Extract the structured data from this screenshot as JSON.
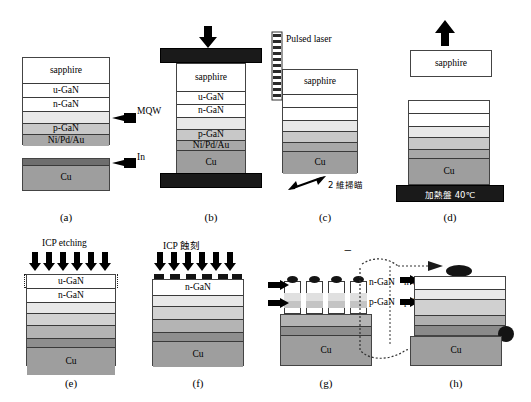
{
  "figure": {
    "colors": {
      "sapphire": "#ffffff",
      "u_gan": "#ffffff",
      "n_gan": "#ffffff",
      "mqw": "#e8e8e8",
      "p_gan": "#c8c8c8",
      "metal": "#a8a8a8",
      "cu": "#9e9e9e",
      "in": "#6e6e6e",
      "plate": "#1a1a1a",
      "outline": "#3a3a3a"
    }
  },
  "panels": [
    {
      "id": "a",
      "caption": "(a)",
      "layers": [
        "sapphire",
        "u-GaN",
        "n-GaN",
        "",
        "p-GaN",
        "Ni/Pd/Au"
      ],
      "callouts": [
        "MQW",
        "In"
      ],
      "substrate": "Cu"
    },
    {
      "id": "b",
      "caption": "(b)",
      "layers": [
        "sapphire",
        "u-GaN",
        "n-GaN",
        "",
        "p-GaN",
        "Ni/Pd/Au",
        "Cu"
      ],
      "annotation": "press-arrow"
    },
    {
      "id": "c",
      "caption": "(c)",
      "laser_label": "Pulsed laser",
      "scan_label": "2 維掃瞄",
      "layers": [
        "sapphire",
        "",
        "",
        "",
        "",
        "",
        "Cu"
      ]
    },
    {
      "id": "d",
      "caption": "(d)",
      "lifted": "sapphire",
      "hotplate_label": "加熱盤 40℃",
      "substrate": "Cu"
    },
    {
      "id": "e",
      "caption": "(e)",
      "process_label": "ICP etching",
      "layers": [
        "u-GaN",
        "n-GaN",
        "",
        "",
        "",
        "Cu"
      ]
    },
    {
      "id": "f",
      "caption": "(f)",
      "process_label": "ICP 蝕刻",
      "layers": [
        "n-GaN",
        "",
        "",
        "",
        "Cu"
      ]
    },
    {
      "id": "g",
      "caption": "(g)",
      "labels": [
        "n-GaN",
        "p-GaN"
      ],
      "terminals": [
        "−",
        "+"
      ],
      "substrate": "Cu"
    },
    {
      "id": "h",
      "caption": "(h)",
      "labels": [
        "n-GaN",
        "p-GaN"
      ],
      "substrate": "Cu"
    }
  ]
}
